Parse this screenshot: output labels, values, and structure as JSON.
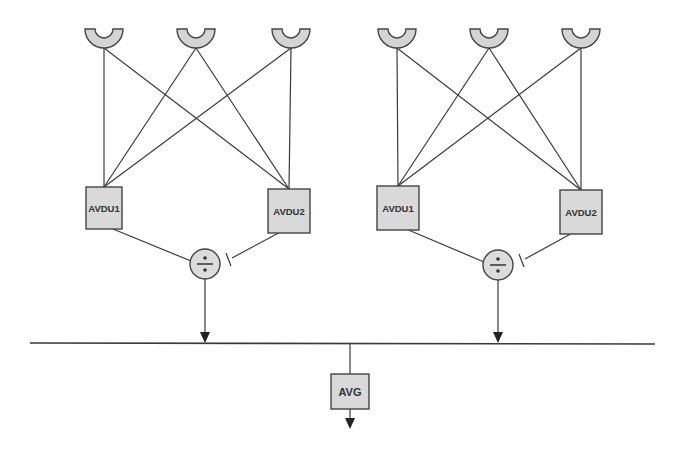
{
  "diagram": {
    "title": "",
    "colors": {
      "stroke": "#3a3a3a",
      "box_fill": "#d9d9d9",
      "sensor_fill": "#d4d4d4",
      "background": "#ffffff"
    },
    "groups": [
      {
        "id": "left",
        "sensors": [
          {
            "cx": 104,
            "top": 29
          },
          {
            "cx": 196,
            "top": 29
          },
          {
            "cx": 291,
            "top": 29
          }
        ],
        "units": [
          {
            "label": "AVDU1",
            "x": 86,
            "y": 187,
            "w": 36,
            "h": 42
          },
          {
            "label": "AVDU2",
            "x": 268,
            "y": 189,
            "w": 42,
            "h": 44
          }
        ],
        "divider": {
          "symbol": "÷",
          "cx": 205,
          "cy": 264,
          "r": 15
        }
      },
      {
        "id": "right",
        "sensors": [
          {
            "cx": 397,
            "top": 29
          },
          {
            "cx": 489,
            "top": 29
          },
          {
            "cx": 581,
            "top": 29
          }
        ],
        "units": [
          {
            "label": "AVDU1",
            "x": 377,
            "y": 186,
            "w": 42,
            "h": 44
          },
          {
            "label": "AVDU2",
            "x": 560,
            "y": 190,
            "w": 42,
            "h": 44
          }
        ],
        "divider": {
          "symbol": "÷",
          "cx": 498,
          "cy": 265,
          "r": 15
        }
      }
    ],
    "bus": {
      "x1": 30,
      "x2": 655,
      "y": 343
    },
    "average": {
      "label": "AVG",
      "x": 331,
      "y": 374,
      "w": 38,
      "h": 35
    }
  }
}
